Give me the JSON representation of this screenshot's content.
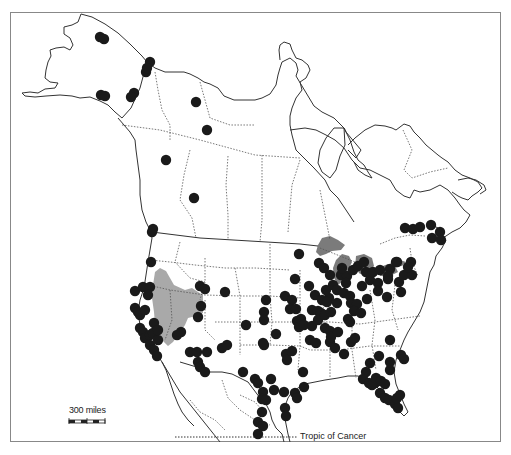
{
  "map": {
    "title": "Distribution map of North America",
    "frame": {
      "x": 10,
      "y": 12,
      "width": 491,
      "height": 430
    },
    "colors": {
      "coastline": "#333333",
      "state_border": "#555555",
      "occurrence_dot": "#1a1a1a",
      "great_basin_shade": "#a9a9a9",
      "great_lakes_shade": "#7b7b7b",
      "frame": "#888888"
    }
  },
  "scale_bar": {
    "label": "300 miles"
  },
  "annotations": {
    "tropic_label": "Tropic of Cancer"
  },
  "legend_regions": [
    {
      "name": "shaded-region-great-basin",
      "shade": "light gray"
    },
    {
      "name": "shaded-region-great-lakes",
      "shade": "dark gray"
    }
  ],
  "occurrence_points": [
    [
      100,
      37
    ],
    [
      104,
      39
    ],
    [
      101,
      95
    ],
    [
      105,
      96
    ],
    [
      134,
      93
    ],
    [
      131,
      97
    ],
    [
      150,
      62
    ],
    [
      146,
      72
    ],
    [
      147,
      68
    ],
    [
      196,
      102
    ],
    [
      207,
      130
    ],
    [
      166,
      160
    ],
    [
      194,
      198
    ],
    [
      152,
      232
    ],
    [
      153,
      229
    ],
    [
      151,
      262
    ],
    [
      135,
      291
    ],
    [
      143,
      287
    ],
    [
      150,
      287
    ],
    [
      148,
      295
    ],
    [
      135,
      308
    ],
    [
      138,
      312
    ],
    [
      140,
      315
    ],
    [
      145,
      310
    ],
    [
      140,
      328
    ],
    [
      143,
      332
    ],
    [
      145,
      338
    ],
    [
      150,
      335
    ],
    [
      153,
      333
    ],
    [
      150,
      345
    ],
    [
      154,
      350
    ],
    [
      157,
      356
    ],
    [
      158,
      340
    ],
    [
      154,
      323
    ],
    [
      158,
      330
    ],
    [
      200,
      286
    ],
    [
      205,
      289
    ],
    [
      201,
      306
    ],
    [
      198,
      317
    ],
    [
      225,
      292
    ],
    [
      177,
      335
    ],
    [
      181,
      332
    ],
    [
      190,
      352
    ],
    [
      197,
      352
    ],
    [
      198,
      362
    ],
    [
      207,
      352
    ],
    [
      200,
      367
    ],
    [
      205,
      372
    ],
    [
      222,
      348
    ],
    [
      227,
      345
    ],
    [
      243,
      372
    ],
    [
      246,
      325
    ],
    [
      299,
      254
    ],
    [
      295,
      279
    ],
    [
      285,
      296
    ],
    [
      292,
      300
    ],
    [
      266,
      300
    ],
    [
      264,
      312
    ],
    [
      264,
      320
    ],
    [
      290,
      309
    ],
    [
      296,
      309
    ],
    [
      297,
      321
    ],
    [
      299,
      327
    ],
    [
      301,
      319
    ],
    [
      312,
      310
    ],
    [
      318,
      311
    ],
    [
      321,
      313
    ],
    [
      318,
      320
    ],
    [
      325,
      315
    ],
    [
      331,
      312
    ],
    [
      329,
      298
    ],
    [
      326,
      290
    ],
    [
      333,
      285
    ],
    [
      341,
      275
    ],
    [
      347,
      276
    ],
    [
      346,
      283
    ],
    [
      337,
      290
    ],
    [
      344,
      293
    ],
    [
      350,
      296
    ],
    [
      351,
      303
    ],
    [
      357,
      304
    ],
    [
      354,
      311
    ],
    [
      348,
      319
    ],
    [
      361,
      313
    ],
    [
      367,
      299
    ],
    [
      362,
      286
    ],
    [
      370,
      280
    ],
    [
      378,
      283
    ],
    [
      378,
      291
    ],
    [
      387,
      297
    ],
    [
      388,
      279
    ],
    [
      399,
      282
    ],
    [
      401,
      292
    ],
    [
      404,
      275
    ],
    [
      412,
      275
    ],
    [
      411,
      262
    ],
    [
      408,
      267
    ],
    [
      396,
      262
    ],
    [
      390,
      269
    ],
    [
      342,
      268
    ],
    [
      353,
      270
    ],
    [
      366,
      272
    ],
    [
      373,
      272
    ],
    [
      380,
      270
    ],
    [
      388,
      276
    ],
    [
      397,
      262
    ],
    [
      358,
      266
    ],
    [
      364,
      262
    ],
    [
      319,
      263
    ],
    [
      324,
      268
    ],
    [
      330,
      275
    ],
    [
      309,
      286
    ],
    [
      315,
      295
    ],
    [
      322,
      300
    ],
    [
      327,
      302
    ],
    [
      337,
      303
    ],
    [
      304,
      325
    ],
    [
      312,
      326
    ],
    [
      325,
      328
    ],
    [
      330,
      331
    ],
    [
      310,
      340
    ],
    [
      316,
      343
    ],
    [
      330,
      342
    ],
    [
      335,
      348
    ],
    [
      344,
      354
    ],
    [
      351,
      342
    ],
    [
      355,
      338
    ],
    [
      350,
      322
    ],
    [
      331,
      337
    ],
    [
      338,
      332
    ],
    [
      263,
      343
    ],
    [
      264,
      345
    ],
    [
      276,
      334
    ],
    [
      286,
      354
    ],
    [
      287,
      360
    ],
    [
      292,
      351
    ],
    [
      303,
      372
    ],
    [
      295,
      393
    ],
    [
      297,
      398
    ],
    [
      304,
      387
    ],
    [
      271,
      379
    ],
    [
      274,
      390
    ],
    [
      284,
      392
    ],
    [
      285,
      408
    ],
    [
      286,
      416
    ],
    [
      390,
      340
    ],
    [
      401,
      355
    ],
    [
      404,
      359
    ],
    [
      379,
      356
    ],
    [
      390,
      370
    ],
    [
      375,
      383
    ],
    [
      390,
      362
    ],
    [
      370,
      363
    ],
    [
      366,
      372
    ],
    [
      363,
      379
    ],
    [
      369,
      383
    ],
    [
      372,
      385
    ],
    [
      376,
      378
    ],
    [
      381,
      381
    ],
    [
      385,
      384
    ],
    [
      380,
      393
    ],
    [
      385,
      398
    ],
    [
      389,
      400
    ],
    [
      395,
      404
    ],
    [
      397,
      398
    ],
    [
      398,
      408
    ],
    [
      400,
      395
    ],
    [
      255,
      379
    ],
    [
      258,
      383
    ],
    [
      263,
      392
    ],
    [
      262,
      399
    ],
    [
      266,
      400
    ],
    [
      262,
      412
    ],
    [
      258,
      422
    ],
    [
      263,
      426
    ],
    [
      258,
      434
    ],
    [
      405,
      228
    ],
    [
      413,
      229
    ],
    [
      420,
      227
    ],
    [
      431,
      225
    ],
    [
      432,
      238
    ],
    [
      440,
      232
    ],
    [
      441,
      240
    ]
  ]
}
